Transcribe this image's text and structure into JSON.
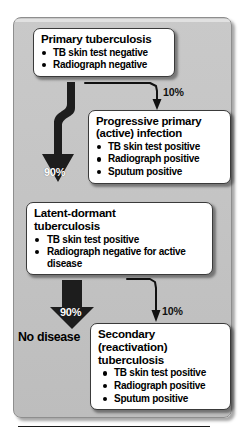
{
  "figure": {
    "name": "tuberculosis-progression-flowchart",
    "panel_color": "#c5c5c5",
    "box_fill": "#ffffff",
    "arrow_color": "#1d1d1d"
  },
  "boxes": [
    {
      "id": "primary",
      "title": "Primary tuberculosis",
      "items": [
        "TB skin test negative",
        "Radiograph negative"
      ]
    },
    {
      "id": "progressive",
      "title_line1": "Progressive primary",
      "title_line2": "(active) infection",
      "items": [
        "TB skin test positive",
        "Radiograph positive",
        "Sputum positive"
      ]
    },
    {
      "id": "latent",
      "title_line1": "Latent-dormant",
      "title_line2": "tuberculosis",
      "items": [
        "TB skin test positive",
        "Radiograph negative for active",
        "disease"
      ]
    },
    {
      "id": "secondary",
      "title_line1": "Secondary",
      "title_line2": "(reactivation)",
      "title_line3": "tuberculosis",
      "items": [
        "TB skin test positive",
        "Radiograph positive",
        "Sputum positive"
      ]
    }
  ],
  "arrows": {
    "primary_to_latent_pct": "90%",
    "primary_to_progressive_pct": "10%",
    "latent_to_no_disease_pct": "90%",
    "latent_to_secondary_pct": "10%"
  },
  "labels": {
    "no_disease": "No disease"
  }
}
